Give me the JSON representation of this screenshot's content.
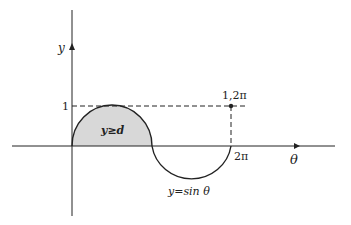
{
  "diagram": {
    "axes": {
      "x_label": "θ",
      "y_label": "y"
    },
    "tick_labels": {
      "y_one": "1",
      "x_two_pi": "2π"
    },
    "point_label": "1,2π",
    "region_label": "y≥d",
    "curve_label": "y=sin θ",
    "colors": {
      "stroke": "#222222",
      "fill": "#d8d8d8"
    }
  }
}
